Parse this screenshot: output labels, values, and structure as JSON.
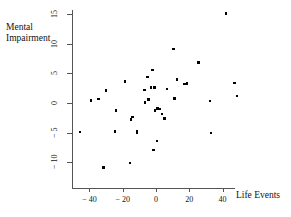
{
  "chart_data": {
    "type": "scatter",
    "title": "",
    "xlabel": "Life Events",
    "ylabel": "Mental\nImpairment",
    "xlim": [
      -48,
      52
    ],
    "ylim": [
      -12,
      16
    ],
    "xticks": [
      -40,
      -20,
      0,
      20,
      40
    ],
    "xtick_labels": [
      "− 40",
      "− 20",
      "0",
      "20",
      "40"
    ],
    "yticks": [
      -10,
      -5,
      0,
      5,
      10,
      15
    ],
    "ytick_labels": [
      "− 10",
      "− 5",
      "0",
      "5",
      "10",
      "15"
    ],
    "grid": false,
    "legend": null,
    "marker": "square",
    "marker_color": "#000000",
    "points": [
      {
        "x": -45.5,
        "y": -4.9
      },
      {
        "x": -39.0,
        "y": 0.4
      },
      {
        "x": -34.5,
        "y": 0.7
      },
      {
        "x": -31.5,
        "y": -10.9
      },
      {
        "x": -30.0,
        "y": 2.1
      },
      {
        "x": -24.5,
        "y": -4.8
      },
      {
        "x": -24.0,
        "y": -1.3
      },
      {
        "x": -18.5,
        "y": 3.6
      },
      {
        "x": -15.5,
        "y": -10.1
      },
      {
        "x": -15.0,
        "y": -2.8
      },
      {
        "x": -14.0,
        "y": -2.4
      },
      {
        "x": -11.5,
        "y": -4.7
      },
      {
        "x": -11.5,
        "y": -5.0
      },
      {
        "x": -7.0,
        "y": 2.2
      },
      {
        "x": -6.5,
        "y": 0.1
      },
      {
        "x": -5.0,
        "y": 4.4
      },
      {
        "x": -4.5,
        "y": 0.6
      },
      {
        "x": -3.0,
        "y": 2.6
      },
      {
        "x": -2.0,
        "y": 5.6
      },
      {
        "x": -1.5,
        "y": -7.9
      },
      {
        "x": -1.0,
        "y": 2.6
      },
      {
        "x": -0.5,
        "y": -1.3
      },
      {
        "x": 0.5,
        "y": -6.4
      },
      {
        "x": 1.0,
        "y": -0.9
      },
      {
        "x": 2.5,
        "y": -1.0
      },
      {
        "x": 3.5,
        "y": -1.9
      },
      {
        "x": 5.0,
        "y": -2.6
      },
      {
        "x": 6.5,
        "y": 2.4
      },
      {
        "x": 10.5,
        "y": 9.1
      },
      {
        "x": 11.0,
        "y": 0.8
      },
      {
        "x": 12.5,
        "y": 4.0
      },
      {
        "x": 17.0,
        "y": 3.2
      },
      {
        "x": 18.5,
        "y": 3.3
      },
      {
        "x": 25.5,
        "y": 6.8
      },
      {
        "x": 32.5,
        "y": 0.3
      },
      {
        "x": 33.0,
        "y": -5.1
      },
      {
        "x": 42.0,
        "y": 15.1
      },
      {
        "x": 47.0,
        "y": 3.4
      },
      {
        "x": 48.5,
        "y": 1.2
      }
    ]
  }
}
